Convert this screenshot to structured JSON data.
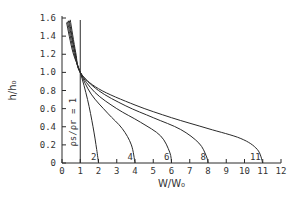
{
  "chart_data": {
    "type": "line",
    "title": "",
    "xlabel": "W/W₀",
    "ylabel": "h/h₀",
    "xlim": [
      0,
      12
    ],
    "ylim": [
      0,
      1.6
    ],
    "grid": false,
    "x_ticks": [
      "0",
      "1",
      "2",
      "3",
      "4",
      "5",
      "6",
      "7",
      "8",
      "9",
      "10",
      "11",
      "12"
    ],
    "y_ticks": [
      "0",
      "0.2",
      "0.4",
      "0.6",
      "0.8",
      "1.0",
      "1.2",
      "1.4",
      "1.6"
    ],
    "reference_line": {
      "x": 1,
      "label": "ρs/ρr = 1"
    },
    "series": [
      {
        "name": "2",
        "points": [
          [
            0.25,
            1.55
          ],
          [
            0.6,
            1.22
          ],
          [
            1,
            1.0
          ],
          [
            1.4,
            0.7
          ],
          [
            1.7,
            0.4
          ],
          [
            1.9,
            0.15
          ],
          [
            2,
            0
          ]
        ]
      },
      {
        "name": "4",
        "points": [
          [
            0.3,
            1.56
          ],
          [
            0.65,
            1.22
          ],
          [
            1,
            1.0
          ],
          [
            1.6,
            0.76
          ],
          [
            2.5,
            0.55
          ],
          [
            3.3,
            0.38
          ],
          [
            3.8,
            0.2
          ],
          [
            4,
            0
          ]
        ]
      },
      {
        "name": "6",
        "points": [
          [
            0.35,
            1.57
          ],
          [
            0.7,
            1.22
          ],
          [
            1,
            1.0
          ],
          [
            1.8,
            0.78
          ],
          [
            3,
            0.6
          ],
          [
            4.3,
            0.45
          ],
          [
            5.4,
            0.3
          ],
          [
            5.9,
            0.12
          ],
          [
            6,
            0
          ]
        ]
      },
      {
        "name": "8",
        "points": [
          [
            0.4,
            1.57
          ],
          [
            0.72,
            1.22
          ],
          [
            1,
            1.0
          ],
          [
            2,
            0.8
          ],
          [
            3.5,
            0.63
          ],
          [
            5,
            0.5
          ],
          [
            6.5,
            0.37
          ],
          [
            7.5,
            0.22
          ],
          [
            7.9,
            0.08
          ],
          [
            8,
            0
          ]
        ]
      },
      {
        "name": "11",
        "points": [
          [
            0.45,
            1.58
          ],
          [
            0.75,
            1.22
          ],
          [
            1,
            1.0
          ],
          [
            2,
            0.82
          ],
          [
            4,
            0.64
          ],
          [
            6,
            0.5
          ],
          [
            8,
            0.38
          ],
          [
            9.8,
            0.27
          ],
          [
            10.7,
            0.15
          ],
          [
            11,
            0
          ]
        ]
      }
    ]
  }
}
